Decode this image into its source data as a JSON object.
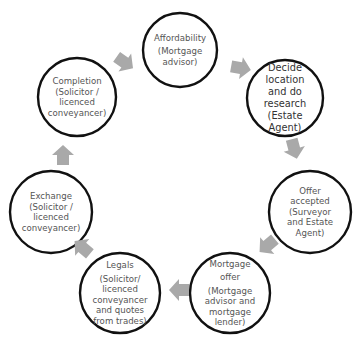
{
  "diagram": {
    "colors": {
      "circle_stroke": "#111111",
      "arrow_fill": "#a9a9a9",
      "text": "#555555"
    },
    "nodes": [
      {
        "id": "affordability",
        "lines": [
          "Affordability",
          "(Mortgage",
          "advisor)"
        ]
      },
      {
        "id": "decide-location",
        "lines": [
          "Decide",
          "location",
          "and do",
          "research",
          "(Estate",
          "Agent)"
        ]
      },
      {
        "id": "offer-accepted",
        "lines": [
          "Offer",
          "accepted",
          "(Surveyor",
          "and Estate",
          "Agent)"
        ]
      },
      {
        "id": "mortgage-offer",
        "lines": [
          "Mortgage",
          "offer",
          "(Mortgage",
          "advisor and",
          "mortgage",
          "lender)"
        ]
      },
      {
        "id": "legals",
        "lines": [
          "Legals",
          "(Solicitor/",
          "licenced",
          "conveyancer",
          "and quotes",
          "from trades)"
        ]
      },
      {
        "id": "exchange",
        "lines": [
          "Exchange",
          "(Solicitor /",
          "licenced",
          "conveyancer)"
        ]
      },
      {
        "id": "completion",
        "lines": [
          "Completion",
          "(Solicitor /",
          "licenced",
          "conveyancer)"
        ]
      }
    ],
    "edges": [
      {
        "from": "affordability",
        "to": "decide-location"
      },
      {
        "from": "decide-location",
        "to": "offer-accepted"
      },
      {
        "from": "offer-accepted",
        "to": "mortgage-offer"
      },
      {
        "from": "mortgage-offer",
        "to": "legals"
      },
      {
        "from": "legals",
        "to": "exchange"
      },
      {
        "from": "exchange",
        "to": "completion"
      },
      {
        "from": "completion",
        "to": "affordability"
      }
    ]
  }
}
